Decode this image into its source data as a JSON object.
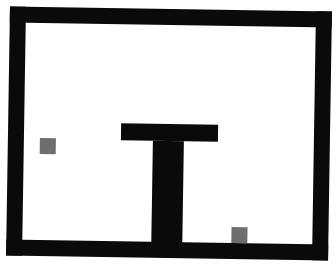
{
  "game": {
    "type": "grid-room",
    "colors": {
      "background": "#ffffff",
      "wall": "#0a0a0a",
      "agent": "#6e6e6e",
      "goal": "#6e6e6e"
    },
    "room": {
      "outer": {
        "x": 8,
        "y": 9,
        "w": 322,
        "h": 249
      },
      "thickness": 16
    },
    "walls": [
      {
        "id": "t-bar-top",
        "x": 121,
        "y": 124,
        "w": 97,
        "h": 17
      },
      {
        "id": "t-bar-stem",
        "x": 153,
        "y": 141,
        "w": 31,
        "h": 102
      }
    ],
    "objects": [
      {
        "id": "agent",
        "x": 40,
        "y": 140,
        "w": 16,
        "h": 16
      },
      {
        "id": "target",
        "x": 233,
        "y": 226,
        "w": 16,
        "h": 16
      }
    ]
  }
}
